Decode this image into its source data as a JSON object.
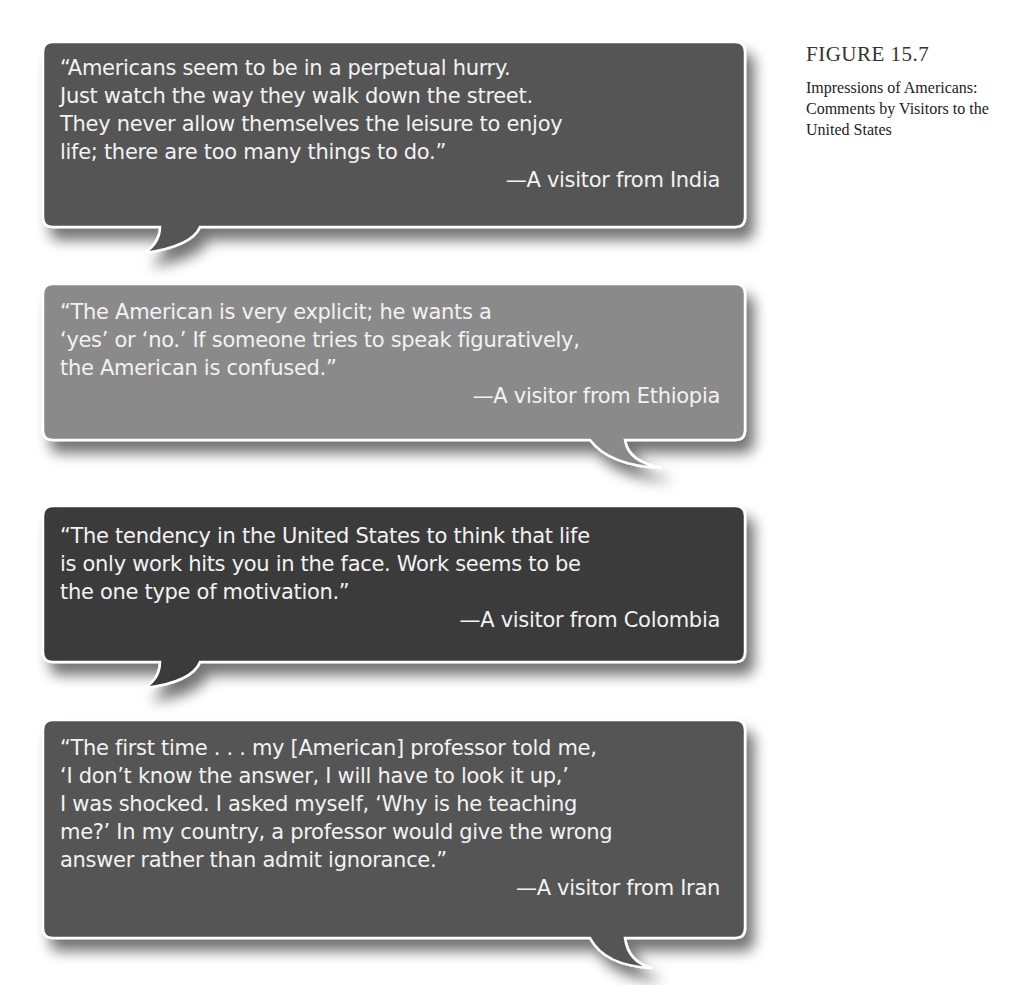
{
  "figure": {
    "label": "FIGURE 15.7",
    "title": "Impressions of Americans: Comments by Visitors to the United States"
  },
  "quotes": [
    {
      "lines": [
        "“Americans seem to be in a perpetual hurry.",
        "Just watch the way they walk down the street.",
        "They never allow themselves the leisure to enjoy",
        "life; there are too many things to do.”"
      ],
      "attribution": "—A visitor from India",
      "fill": "#555555",
      "tail": "left"
    },
    {
      "lines": [
        "“The American is very explicit; he wants a",
        "‘yes’ or ‘no.’ If someone tries to speak figuratively,",
        "the American is confused.”"
      ],
      "attribution": "—A visitor from Ethiopia",
      "fill": "#8a8a8a",
      "tail": "right"
    },
    {
      "lines": [
        "“The tendency in the United States to think that life",
        "is only work hits you in the face. Work seems to be",
        "the one type of motivation.”"
      ],
      "attribution": "—A visitor from Colombia",
      "fill": "#3a3a3a",
      "tail": "left"
    },
    {
      "lines": [
        "“The first time . . . my [American] professor told me,",
        "‘I don’t know the answer, I will have to look it up,’",
        "I was shocked. I asked myself, ‘Why is he teaching",
        "me?’ In my country, a professor would give the wrong",
        "answer rather than admit ignorance.”"
      ],
      "attribution": "—A visitor from Iran",
      "fill": "#555555",
      "tail": "right"
    }
  ]
}
